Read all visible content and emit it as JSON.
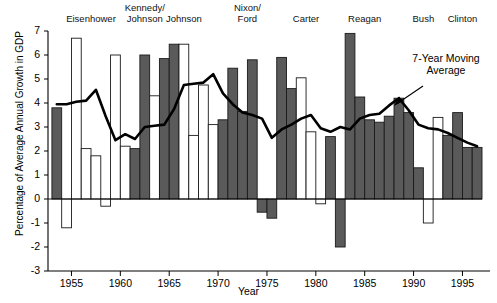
{
  "chart_data": {
    "type": "bar",
    "title": "",
    "xlabel": "Year",
    "ylabel": "Percentage of Average Annual Growth in GDP",
    "ylim": [
      -3,
      7
    ],
    "xlim": [
      1952.5,
      1997.0
    ],
    "yticks": [
      -3,
      -2,
      -1,
      0,
      1,
      2,
      3,
      4,
      5,
      6,
      7
    ],
    "ytick_labels": [
      "-3",
      "-2",
      "-1",
      "0",
      "1",
      "2",
      "3",
      "4",
      "5",
      "6",
      "7"
    ],
    "xticks": [
      1955,
      1960,
      1965,
      1970,
      1975,
      1980,
      1985,
      1990,
      1995
    ],
    "xtick_labels": [
      "1955",
      "1960",
      "1965",
      "1970",
      "1975",
      "1980",
      "1985",
      "1990",
      "1995"
    ],
    "grid": false,
    "legend_position": "none",
    "bar_fill_dark": "#5a5a5a",
    "bar_fill_light": "#ffffff",
    "bar_edge": "#1a1a1a",
    "line_color": "#000000",
    "series": [
      {
        "name": "Annual Growth in GDP",
        "categories": [
          1953,
          1954,
          1955,
          1956,
          1957,
          1958,
          1959,
          1960,
          1961,
          1962,
          1963,
          1964,
          1965,
          1966,
          1967,
          1968,
          1969,
          1970,
          1971,
          1972,
          1973,
          1974,
          1975,
          1976,
          1977,
          1978,
          1979,
          1980,
          1981,
          1982,
          1983,
          1984,
          1985,
          1986,
          1987,
          1988,
          1989,
          1990,
          1991,
          1992,
          1993,
          1994,
          1995,
          1996
        ],
        "values": [
          3.8,
          -1.2,
          6.7,
          2.1,
          1.8,
          -0.3,
          6.0,
          2.2,
          2.1,
          6.0,
          4.3,
          5.85,
          6.45,
          6.45,
          2.65,
          4.75,
          3.1,
          3.3,
          5.45,
          3.65,
          5.8,
          -0.55,
          -0.8,
          5.9,
          4.6,
          5.05,
          2.8,
          -0.2,
          2.6,
          -2.0,
          6.9,
          4.25,
          3.3,
          3.2,
          3.45,
          4.2,
          3.6,
          1.3,
          -1.0,
          3.4,
          2.65,
          3.6,
          2.15,
          2.15
        ],
        "shading": [
          "dark",
          "light",
          "light",
          "light",
          "light",
          "light",
          "light",
          "light",
          "dark",
          "dark",
          "light",
          "dark",
          "dark",
          "light",
          "light",
          "light",
          "light",
          "dark",
          "dark",
          "dark",
          "dark",
          "dark",
          "dark",
          "dark",
          "dark",
          "light",
          "light",
          "light",
          "dark",
          "dark",
          "dark",
          "dark",
          "dark",
          "dark",
          "dark",
          "dark",
          "dark",
          "dark",
          "light",
          "light",
          "dark",
          "dark",
          "dark",
          "dark"
        ]
      },
      {
        "name": "7-Year Moving Average",
        "type": "line",
        "x": [
          1953,
          1954,
          1955,
          1956,
          1957,
          1958,
          1959,
          1960,
          1961,
          1962,
          1963,
          1964,
          1965,
          1966,
          1967,
          1968,
          1969,
          1970,
          1971,
          1972,
          1973,
          1974,
          1975,
          1976,
          1977,
          1978,
          1979,
          1980,
          1981,
          1982,
          1983,
          1984,
          1985,
          1986,
          1987,
          1988,
          1989,
          1990,
          1991,
          1992,
          1993,
          1994,
          1995,
          1996
        ],
        "values": [
          3.95,
          3.95,
          4.05,
          4.1,
          4.55,
          3.45,
          2.45,
          2.7,
          2.5,
          3.0,
          3.05,
          3.1,
          3.75,
          4.75,
          4.8,
          4.85,
          5.2,
          4.4,
          3.95,
          3.6,
          3.5,
          3.35,
          2.55,
          2.9,
          3.1,
          3.35,
          3.5,
          2.95,
          2.8,
          3.0,
          2.9,
          3.35,
          3.5,
          3.55,
          3.9,
          4.2,
          3.7,
          3.1,
          2.95,
          2.9,
          2.75,
          2.55,
          2.35,
          2.2
        ]
      }
    ],
    "annotations": [
      {
        "text": "7-Year Moving Average",
        "points_to_year": 1989.5,
        "points_to_value": 3.85
      }
    ],
    "period_labels": [
      {
        "label": "Eisenhower",
        "start": 1953,
        "end": 1960
      },
      {
        "label": "Kennedy/\nJohnson",
        "start": 1961,
        "end": 1963
      },
      {
        "label": "Johnson",
        "start": 1964,
        "end": 1968
      },
      {
        "label": "Nixon/\nFord",
        "start": 1969,
        "end": 1976
      },
      {
        "label": "Carter",
        "start": 1977,
        "end": 1980
      },
      {
        "label": "Reagan",
        "start": 1981,
        "end": 1988
      },
      {
        "label": "Bush",
        "start": 1989,
        "end": 1992
      },
      {
        "label": "Clinton",
        "start": 1993,
        "end": 1996
      }
    ]
  },
  "axes": {
    "ylabel": "Percentage of Average Annual Growth in GDP",
    "xlabel": "Year"
  },
  "annotation": {
    "line1": "7-Year Moving",
    "line2": "Average"
  },
  "periods": [
    {
      "label_line1": "Eisenhower",
      "label_line2": ""
    },
    {
      "label_line1": "Kennedy/",
      "label_line2": "Johnson"
    },
    {
      "label_line1": "Johnson",
      "label_line2": ""
    },
    {
      "label_line1": "Nixon/",
      "label_line2": "Ford"
    },
    {
      "label_line1": "Carter",
      "label_line2": ""
    },
    {
      "label_line1": "Reagan",
      "label_line2": ""
    },
    {
      "label_line1": "Bush",
      "label_line2": ""
    },
    {
      "label_line1": "Clinton",
      "label_line2": ""
    }
  ]
}
